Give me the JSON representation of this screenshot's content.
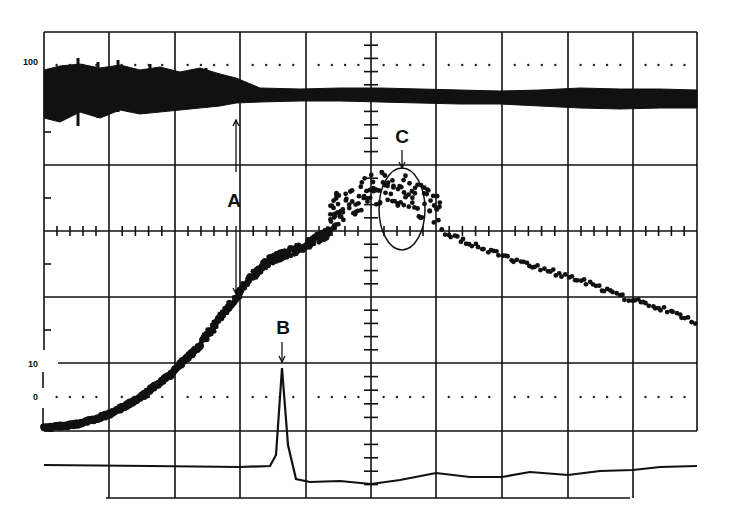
{
  "chart_data": {
    "type": "line",
    "title": "",
    "xlabel": "",
    "ylabel": "",
    "grid": true,
    "grid_divisions": {
      "x": 10,
      "y": 7
    },
    "axis_labels": [
      {
        "text": "100",
        "y_px": 62
      },
      {
        "text": "10",
        "y_px": 364
      },
      {
        "text": "0",
        "y_px": 397
      }
    ],
    "annotations": [
      {
        "label": "A",
        "description": "vertical arrows marking transition in top band and curve shoulder",
        "x_px": 236
      },
      {
        "label": "B",
        "description": "sharp peak in bottom trace",
        "x_px": 282
      },
      {
        "label": "C",
        "description": "ellipse around scattered points near curve maximum",
        "x_px": 402
      }
    ],
    "series": [
      {
        "name": "top-amplitude-band",
        "style": "filled band",
        "x": [
          44,
          60,
          80,
          100,
          120,
          140,
          160,
          180,
          200,
          220,
          236,
          260,
          300,
          340,
          380,
          420,
          460,
          500,
          540,
          580,
          620,
          660,
          697
        ],
        "upper": [
          70,
          66,
          64,
          68,
          65,
          70,
          67,
          72,
          68,
          74,
          78,
          88,
          89,
          88,
          88,
          89,
          90,
          91,
          90,
          88,
          89,
          89,
          90
        ],
        "lower": [
          118,
          122,
          112,
          118,
          110,
          114,
          112,
          110,
          108,
          106,
          103,
          102,
          101,
          101,
          102,
          103,
          104,
          104,
          106,
          108,
          109,
          108,
          108
        ]
      },
      {
        "name": "main-curve",
        "style": "scatter-dense",
        "x": [
          44,
          80,
          110,
          140,
          170,
          200,
          220,
          236,
          250,
          270,
          300,
          330,
          350,
          370,
          390,
          410,
          430,
          460,
          500,
          540,
          580,
          620,
          660,
          697
        ],
        "y": [
          428,
          424,
          414,
          398,
          375,
          345,
          318,
          298,
          278,
          260,
          248,
          232,
          220,
          210,
          205,
          212,
          225,
          240,
          255,
          268,
          280,
          296,
          308,
          323
        ]
      },
      {
        "name": "bottom-trace",
        "style": "line",
        "x": [
          44,
          150,
          240,
          270,
          276,
          282,
          288,
          296,
          310,
          340,
          371,
          400,
          436,
          470,
          502,
          530,
          568,
          600,
          633,
          660,
          697
        ],
        "y": [
          465,
          466,
          467,
          466,
          455,
          368,
          445,
          479,
          482,
          481,
          484,
          480,
          473,
          477,
          477,
          472,
          475,
          471,
          470,
          467,
          466
        ]
      }
    ]
  }
}
